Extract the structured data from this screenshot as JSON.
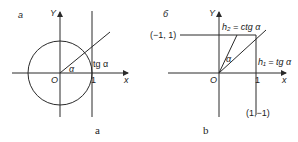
{
  "panel_a": {
    "tag": "a",
    "axis_y": "Y",
    "axis_x": "x",
    "origin": "O",
    "one": "1",
    "angle": "α",
    "tangent_label": "tg α",
    "caption": "a"
  },
  "panel_b": {
    "tag": "б",
    "axis_y": "Y",
    "axis_x": "x",
    "origin": "O",
    "one": "1",
    "angle": "α",
    "point_top_left": "(−1, 1)",
    "point_bottom_right": "(1,−1)",
    "h2_label": "h₂ = ctg α",
    "h1_label": "h₁ = tg α",
    "caption": "b"
  }
}
